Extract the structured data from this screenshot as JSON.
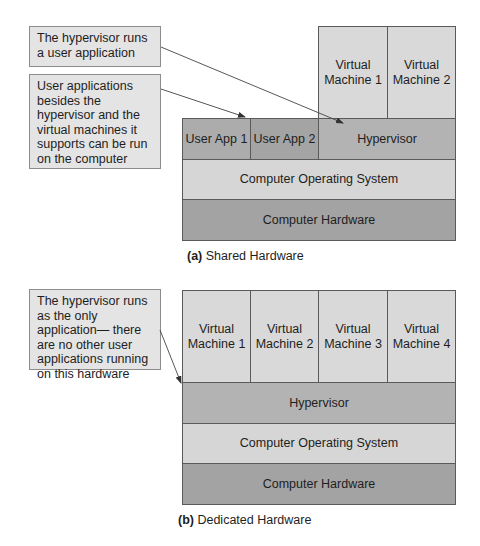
{
  "figure_a": {
    "callouts": [
      {
        "text": "The hypervisor runs a user application"
      },
      {
        "text": "User applications besides the hypervisor and the virtual machines it supports can be run on the computer"
      }
    ],
    "virtual_machines": [
      {
        "line1": "Virtual",
        "line2": "Machine 1"
      },
      {
        "line1": "Virtual",
        "line2": "Machine 2"
      }
    ],
    "user_apps": [
      "User App 1",
      "User App 2"
    ],
    "hypervisor": "Hypervisor",
    "os": "Computer Operating System",
    "hardware": "Computer Hardware",
    "caption_label": "(a)",
    "caption_text": " Shared Hardware"
  },
  "figure_b": {
    "callout": {
      "text": "The hypervisor runs as the only application— there are no other user applications running on this hardware"
    },
    "virtual_machines": [
      {
        "line1": "Virtual",
        "line2": "Machine 1"
      },
      {
        "line1": "Virtual",
        "line2": "Machine 2"
      },
      {
        "line1": "Virtual",
        "line2": "Machine 3"
      },
      {
        "line1": "Virtual",
        "line2": "Machine 4"
      }
    ],
    "hypervisor": "Hypervisor",
    "os": "Computer Operating System",
    "hardware": "Computer Hardware",
    "caption_label": "(b)",
    "caption_text": " Dedicated Hardware"
  },
  "colors": {
    "callout_bg": "#e4e4e4",
    "vm_bg": "#d9d9d9",
    "app_bg": "#acacac",
    "hypervisor_bg": "#b3b3b3",
    "os_bg": "#d6d6d6",
    "hardware_bg": "#a3a3a3",
    "border": "#5a5a5a"
  }
}
